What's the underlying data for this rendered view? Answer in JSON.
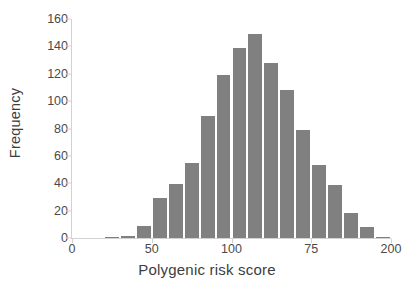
{
  "chart_data": {
    "type": "bar",
    "title": "",
    "xlabel": "Polygenic risk score",
    "ylabel": "Frequency",
    "ylim": [
      0,
      160
    ],
    "xlim": [
      0,
      200
    ],
    "grid": false,
    "legend": null,
    "bar_color": "#808080",
    "axis_color": "#d2d2d2",
    "text_color": "#4a4a4a",
    "ytick_labels": [
      "160",
      "140",
      "120",
      "100",
      "80",
      "60",
      "40",
      "20",
      "0"
    ],
    "ytick_values": [
      160,
      140,
      120,
      100,
      80,
      60,
      40,
      20,
      0
    ],
    "xtick_labels": [
      "0",
      "50",
      "100",
      "75",
      "200"
    ],
    "xtick_values": [
      0,
      50,
      100,
      150,
      200
    ],
    "bin_width": 10,
    "bins": [
      {
        "center": 15,
        "label": "10-20",
        "value": 0
      },
      {
        "center": 25,
        "label": "20-30",
        "value": 1
      },
      {
        "center": 35,
        "label": "30-40",
        "value": 1.5
      },
      {
        "center": 45,
        "label": "40-50",
        "value": 9
      },
      {
        "center": 55,
        "label": "50-60",
        "value": 29.5
      },
      {
        "center": 65,
        "label": "60-70",
        "value": 39.5
      },
      {
        "center": 75,
        "label": "70-80",
        "value": 54.5
      },
      {
        "center": 85,
        "label": "80-90",
        "value": 89
      },
      {
        "center": 95,
        "label": "90-100",
        "value": 119
      },
      {
        "center": 105,
        "label": "100-110",
        "value": 139
      },
      {
        "center": 115,
        "label": "110-120",
        "value": 149
      },
      {
        "center": 125,
        "label": "120-130",
        "value": 128
      },
      {
        "center": 135,
        "label": "130-140",
        "value": 108
      },
      {
        "center": 145,
        "label": "140-150",
        "value": 79
      },
      {
        "center": 155,
        "label": "150-160",
        "value": 53.5
      },
      {
        "center": 165,
        "label": "160-170",
        "value": 38.5
      },
      {
        "center": 175,
        "label": "170-180",
        "value": 18
      },
      {
        "center": 185,
        "label": "180-190",
        "value": 8
      },
      {
        "center": 195,
        "label": "190-200",
        "value": 1
      }
    ],
    "categories": [
      "10-20",
      "20-30",
      "30-40",
      "40-50",
      "50-60",
      "60-70",
      "70-80",
      "80-90",
      "90-100",
      "100-110",
      "110-120",
      "120-130",
      "130-140",
      "140-150",
      "150-160",
      "160-170",
      "170-180",
      "180-190",
      "190-200"
    ],
    "values": [
      0,
      1,
      1.5,
      9,
      29.5,
      39.5,
      54.5,
      89,
      119,
      139,
      149,
      128,
      108,
      79,
      53.5,
      38.5,
      18,
      8,
      1
    ]
  }
}
